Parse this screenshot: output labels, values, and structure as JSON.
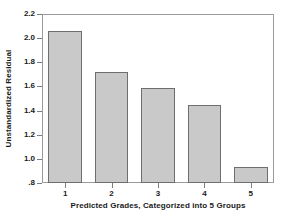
{
  "chart_data": {
    "type": "bar",
    "title": "",
    "xlabel": "Predicted Grades, Categorized into 5 Groups",
    "ylabel": "Unstandardized Residual",
    "categories": [
      "1",
      "2",
      "3",
      "4",
      "5"
    ],
    "values": [
      2.06,
      1.72,
      1.59,
      1.45,
      0.93
    ],
    "ylim": [
      0.8,
      2.2
    ],
    "ytick_labels": [
      "2.2",
      "2.0",
      "1.8",
      "1.6",
      "1.4",
      "1.2",
      "1.0",
      ".8"
    ],
    "ytick_values": [
      2.2,
      2.0,
      1.8,
      1.6,
      1.4,
      1.2,
      1.0,
      0.8
    ],
    "xtick_labels": [
      "1",
      "2",
      "3",
      "4",
      "5"
    ],
    "grid": false,
    "legend": false,
    "bar_fill_color": "#c9c9c9",
    "bar_edge_color": "#6e6e6e",
    "frame_color": "#9a9a9a",
    "text_color": "#1a1a1a",
    "background_color": "#ffffff"
  }
}
